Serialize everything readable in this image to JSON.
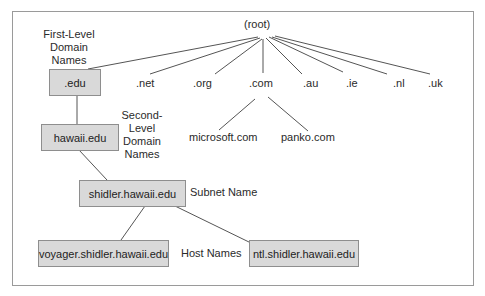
{
  "diagram": {
    "root": "(root)",
    "top_level": [
      ".edu",
      ".net",
      ".org",
      ".com",
      ".au",
      ".ie",
      ".nl",
      ".uk"
    ],
    "com_children": [
      "microsoft.com",
      "panko.com"
    ],
    "edu_chain": {
      "first_level": ".edu",
      "second_level": "hawaii.edu",
      "subnet": "shidler.hawaii.edu",
      "hosts": [
        "voyager.shidler.hawaii.edu",
        "ntl.shidler.hawaii.edu"
      ]
    },
    "captions": {
      "first_level": "First-Level Domain Names",
      "second_level": "Second-Level Domain Names",
      "subnet": "Subnet Name",
      "hosts": "Host Names"
    },
    "colors": {
      "box_fill": "#d9d9d9",
      "box_border": "#8e8e8e",
      "line": "#555555",
      "frame": "#9a9a9a"
    }
  }
}
